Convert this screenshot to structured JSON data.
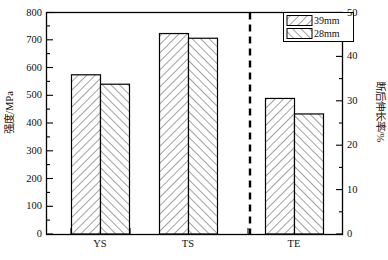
{
  "chart_data": {
    "type": "bar",
    "title": "",
    "subtitle": "",
    "categories": [
      "YS",
      "TS",
      "TE"
    ],
    "series": [
      {
        "name": "39mm",
        "values": [
          575,
          724,
          30.6
        ],
        "hatch": "/"
      },
      {
        "name": "28mm",
        "values": [
          541,
          707,
          27.1
        ],
        "hatch": "\\"
      }
    ],
    "axes": {
      "left": {
        "label": "强度/MPa",
        "min": 0,
        "max": 800,
        "major_step": 100,
        "minor_step": 50,
        "ticks": [
          "0",
          "100",
          "200",
          "300",
          "400",
          "500",
          "600",
          "700",
          "800"
        ],
        "applies_to": [
          "YS",
          "TS"
        ]
      },
      "right": {
        "label": "断后伸长率/%",
        "min": 0,
        "max": 50,
        "major_step": 10,
        "minor_step": 5,
        "ticks": [
          "0",
          "10",
          "20",
          "30",
          "40",
          "50"
        ],
        "applies_to": [
          "TE"
        ]
      },
      "x": {
        "label": "",
        "tick_labels": [
          "YS",
          "TS",
          "TE"
        ]
      }
    },
    "legend": {
      "position": "top-right",
      "entries": [
        {
          "label": "39mm",
          "hatch": "/"
        },
        {
          "label": "28mm",
          "hatch": "\\"
        }
      ]
    },
    "annotations": [
      {
        "type": "vertical-dashed-divider",
        "between": [
          "TS",
          "TE"
        ],
        "note": "separates strength axis groups from elongation group"
      }
    ],
    "grid": false,
    "frame": true,
    "colors": {
      "axis": "#000000",
      "bar_edge": "#000000",
      "bar_fill": "#ffffff",
      "hatch": "#555555",
      "divider": "#000000"
    }
  }
}
